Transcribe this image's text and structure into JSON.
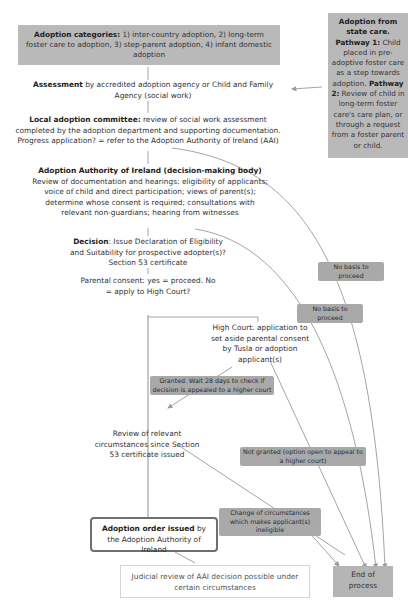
{
  "nodes": {
    "categories": {
      "bold": "Adoption categories:",
      "text": " 1) inter-country adoption, 2) long-term foster care to adoption, 3) step-parent adoption, 4) infant domestic adoption"
    },
    "state_care": {
      "title": "Adoption from state care.",
      "p1_label": "Pathway 1:",
      "p1_text": " Child placed in pre-adoptive foster care as a step towards adoption.",
      "p2_label": " Pathway 2:",
      "p2_text": " Review of child in long-term foster care's care plan, or through a request from a foster parent or child."
    },
    "assessment": {
      "bold": "Assessment",
      "text": " by accredited adoption agency or Child and Family Agency (social work)"
    },
    "local_committee": {
      "bold": "Local adoption committee:",
      "text": " review of social work assessment completed by the adoption department and supporting documentation. Progress application? = refer to the Adoption Authority of Ireland (AAI)"
    },
    "aai": {
      "bold": "Adoption Authority of Ireland (decision-making body)",
      "text": "Review of documentation and hearings: eligibility of applicants; voice of child and direct participation; views of parent(s); determine whose consent is required; consultations with relevant non-guardians; hearing from witnesses"
    },
    "decision": {
      "bold": "Decision",
      "text": ": Issue Declaration of Eligibility and Suitability for prospective adopter(s)? Section 53 certificate"
    },
    "parental_consent": {
      "text": "Parental consent: yes = proceed. No = apply to High Court?"
    },
    "high_court": {
      "text": "High Court: application to set aside parental consent by Tusla or adoption applicant(s)"
    },
    "review": {
      "text": "Review of relevant circumstances since Section 53 certificate issued"
    },
    "adoption_order": {
      "bold": "Adoption order issued",
      "text": " by the Adoption Authority of Ireland"
    },
    "judicial_review": {
      "text": "Judicial review of AAI decision possible under certain circumstances"
    },
    "end": {
      "text": "End of process"
    }
  },
  "edge_labels": {
    "no_basis_1": "No basis to proceed",
    "no_basis_2": "No basis to proceed",
    "granted": "Granted. Wait 28 days to check if decision is appealed to a higher court",
    "not_granted": "Not granted (option open to appeal to a higher court)",
    "change_circumstances": "Change of circumstances which makes applicant(s) ineligible"
  },
  "colors": {
    "box_gray": "#b9b9b9",
    "label_gray": "#a9a9a9",
    "line": "#9a9a9a",
    "order_border": "#6f6f6f"
  }
}
